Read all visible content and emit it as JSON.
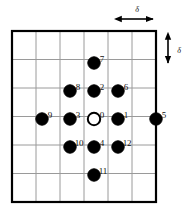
{
  "figure": {
    "title": "",
    "grid": {
      "x0": 12,
      "y0": 31,
      "x1": 156,
      "y1": 202,
      "cols": 6,
      "rows": 6,
      "cell_w": 24,
      "cell_h": 28.5,
      "border_color": "#000000",
      "line_color": "#9a9a9a",
      "border_width": 2.2,
      "line_width": 1.0
    },
    "spacing_annotation": {
      "symbol": "δ",
      "horizontal": {
        "label": "δ",
        "x_start": 118,
        "x_end": 156,
        "y": 19,
        "label_x": 137,
        "label_y": 9
      },
      "vertical": {
        "label": "δ",
        "y_start": 36,
        "y_end": 66,
        "x": 168,
        "label_x": 179,
        "label_y": 50
      }
    },
    "dot_style": {
      "radius": 6.2,
      "fill_filled": "#000000",
      "fill_open": "#ffffff",
      "stroke": "#000000",
      "stroke_width": 2.0
    },
    "nodes": [
      {
        "id": "0",
        "label": "0",
        "cx": 94,
        "cy": 119,
        "filled": false,
        "label_x": 102,
        "label_y": 111
      },
      {
        "id": "1",
        "label": "1",
        "cx": 118,
        "cy": 119,
        "filled": true,
        "label_x": 126,
        "label_y": 111
      },
      {
        "id": "2",
        "label": "2",
        "cx": 94,
        "cy": 91,
        "filled": true,
        "label_x": 102,
        "label_y": 83
      },
      {
        "id": "3",
        "label": "3",
        "cx": 70,
        "cy": 119,
        "filled": true,
        "label_x": 78,
        "label_y": 111
      },
      {
        "id": "4",
        "label": "4",
        "cx": 94,
        "cy": 147,
        "filled": true,
        "label_x": 102,
        "label_y": 139
      },
      {
        "id": "5",
        "label": "5",
        "cx": 156,
        "cy": 119,
        "filled": true,
        "label_x": 164,
        "label_y": 111
      },
      {
        "id": "6",
        "label": "6",
        "cx": 118,
        "cy": 91,
        "filled": true,
        "label_x": 126,
        "label_y": 83
      },
      {
        "id": "7",
        "label": "7",
        "cx": 94,
        "cy": 63,
        "filled": true,
        "label_x": 102,
        "label_y": 55
      },
      {
        "id": "8",
        "label": "8",
        "cx": 70,
        "cy": 91,
        "filled": true,
        "label_x": 78,
        "label_y": 83
      },
      {
        "id": "9",
        "label": "9",
        "cx": 42,
        "cy": 119,
        "filled": true,
        "label_x": 50,
        "label_y": 111
      },
      {
        "id": "10",
        "label": "10",
        "cx": 70,
        "cy": 147,
        "filled": true,
        "label_x": 79,
        "label_y": 139
      },
      {
        "id": "11",
        "label": "11",
        "cx": 94,
        "cy": 175,
        "filled": true,
        "label_x": 103,
        "label_y": 167
      },
      {
        "id": "12",
        "label": "12",
        "cx": 118,
        "cy": 147,
        "filled": true,
        "label_x": 127,
        "label_y": 139
      }
    ]
  },
  "chart_data": {
    "type": "scatter",
    "xlabel": "",
    "ylabel": "",
    "grid": true,
    "legend": null,
    "annotations": [
      "δ (horizontal grid spacing)",
      "δ (vertical grid spacing)"
    ],
    "point_labels": [
      "0",
      "1",
      "2",
      "3",
      "4",
      "5",
      "6",
      "7",
      "8",
      "9",
      "10",
      "11",
      "12"
    ],
    "x": [
      0,
      1,
      0,
      -1,
      0,
      2.6,
      1,
      0,
      -1,
      -2,
      -1,
      0,
      1
    ],
    "y": [
      0,
      0,
      1,
      0,
      -1,
      0,
      1,
      2,
      1,
      0,
      -1,
      -2,
      -1
    ],
    "marker_filled": [
      false,
      true,
      true,
      true,
      true,
      true,
      true,
      true,
      true,
      true,
      true,
      true,
      true
    ],
    "xlim": [
      -3.4,
      3.6
    ],
    "ylim": [
      -3.1,
      3.1
    ]
  }
}
